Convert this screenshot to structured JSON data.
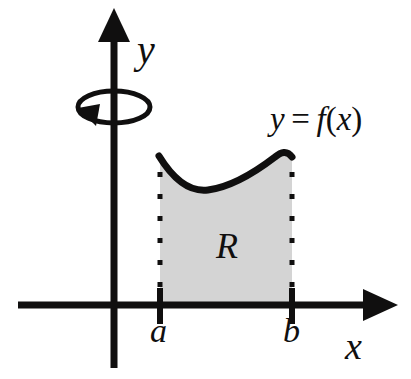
{
  "figure": {
    "name": "solid-of-revolution-region",
    "background_color": "#ffffff",
    "ink_color": "#100f0f",
    "region_fill_color": "#d4d4d4"
  },
  "axes": {
    "y_axis_label": "y",
    "x_axis_label": "x",
    "y_axis_x_px": 114,
    "x_axis_y_px": 305,
    "y_axis_top_px": 10,
    "y_axis_bottom_px": 368,
    "x_axis_left_px": 18,
    "x_axis_right_px": 396,
    "axis_stroke_width": 7
  },
  "ticks": [
    {
      "label": "a",
      "x_px": 160
    },
    {
      "label": "b",
      "x_px": 292
    }
  ],
  "curve": {
    "label_y": "y",
    "label_equals": "=",
    "label_f": "f",
    "label_open": "(",
    "label_arg": "x",
    "label_close": ")",
    "label_full": "y = f(x)",
    "stroke_width": 7,
    "start_px": [
      159,
      157
    ],
    "minimum_px": [
      208,
      190
    ],
    "maximum_px": [
      286,
      152
    ],
    "end_px": [
      292,
      157
    ]
  },
  "region": {
    "label": "R",
    "left_x_px": 160,
    "right_x_px": 292,
    "baseline_y_px": 305,
    "dotted_edge_dot_size": 5,
    "dotted_edge_spacing": 22
  },
  "revolution_arrow": {
    "name": "rotation-about-y-axis",
    "center_px": [
      114,
      107
    ],
    "radius_x_px": 36,
    "radius_y_px": 16,
    "stroke_width": 5,
    "arrowhead_at_px": [
      97,
      121
    ]
  }
}
